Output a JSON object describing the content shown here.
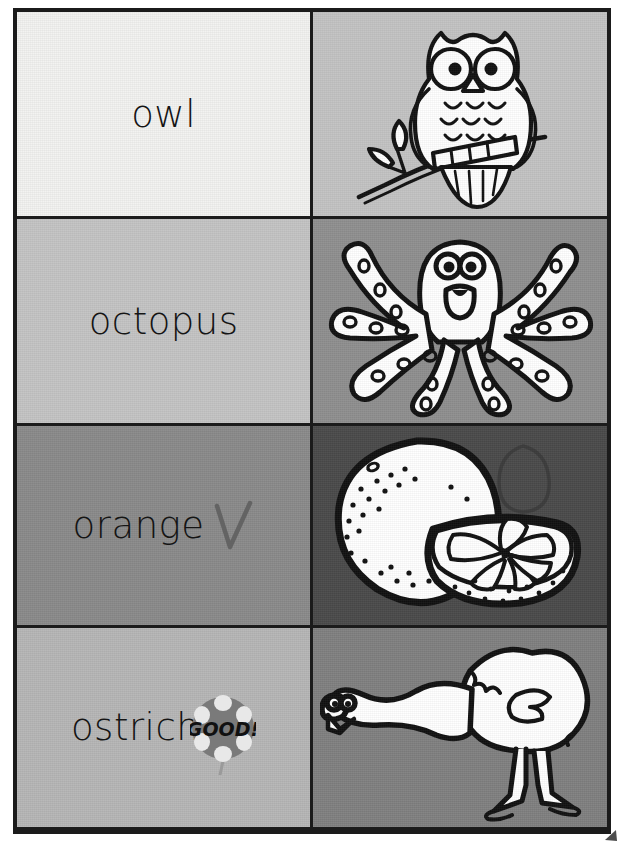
{
  "page": {
    "frame_color": "#1b1b1b",
    "background": "#ffffff"
  },
  "rows": [
    {
      "word": "owl",
      "word_cell_bg": "#f2f2f0",
      "picture_cell_bg": "#c3c3c3",
      "picture": "owl-illustration",
      "picture_name": "owl",
      "marks": []
    },
    {
      "word": "octopus",
      "word_cell_bg": "#c4c4c4",
      "picture_cell_bg": "#8f8f8f",
      "picture": "octopus-illustration",
      "picture_name": "octopus",
      "marks": []
    },
    {
      "word": "orange",
      "word_cell_bg": "#8a8a8a",
      "picture_cell_bg": "#4a4a4a",
      "picture": "orange-illustration",
      "picture_name": "orange",
      "marks": [
        "handwritten-check-mark",
        "handwritten-letter-o"
      ]
    },
    {
      "word": "ostrich",
      "word_cell_bg": "#b6b6b6",
      "picture_cell_bg": "#808080",
      "picture": "ostrich-illustration",
      "picture_name": "ostrich",
      "marks": [
        "good-sticker"
      ]
    }
  ],
  "sticker": {
    "label": "GOOD!",
    "shape": "flower-circle",
    "fill": "#7a7a7a",
    "petal_fill": "#e8e8e8",
    "text_color": "#111111"
  },
  "icons": {
    "check": "handwritten-check-icon",
    "letter_o": "handwritten-o-icon",
    "corner": "page-corner-mark-icon"
  }
}
